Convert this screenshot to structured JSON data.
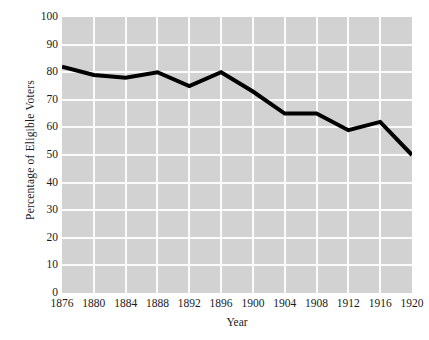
{
  "chart_data": {
    "type": "line",
    "title": "",
    "xlabel": "Year",
    "ylabel": "Percentage of Eligible Voters",
    "x": [
      1876,
      1880,
      1884,
      1888,
      1892,
      1896,
      1900,
      1904,
      1908,
      1912,
      1916,
      1920
    ],
    "xtick_labels": [
      "1876",
      "1880",
      "1884",
      "1888",
      "1892",
      "1896",
      "1900",
      "1904",
      "1908",
      "1912",
      "1916",
      "1920"
    ],
    "values": [
      82,
      79,
      78,
      80,
      75,
      80,
      73,
      65,
      65,
      59,
      62,
      50
    ],
    "ytick_labels": [
      "0",
      "10",
      "20",
      "30",
      "40",
      "50",
      "60",
      "70",
      "80",
      "90",
      "100"
    ],
    "yticks": [
      0,
      10,
      20,
      30,
      40,
      50,
      60,
      70,
      80,
      90,
      100
    ],
    "ylim": [
      0,
      100
    ],
    "xlim": [
      1876,
      1920
    ],
    "grid": true,
    "legend": "none",
    "line_color": "#000000",
    "line_width": 4,
    "plot_background": "#d2d2d2",
    "grid_color": "#fbfbfb",
    "figure_background": "#ffffff"
  }
}
